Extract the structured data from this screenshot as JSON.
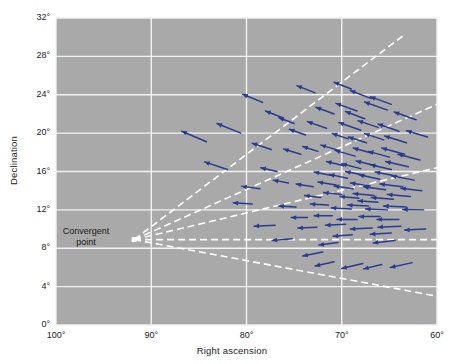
{
  "chart_data": {
    "type": "scatter",
    "title": "",
    "xlabel": "Right ascension",
    "ylabel": "Declination",
    "xlim": [
      100,
      60
    ],
    "ylim": [
      0,
      32
    ],
    "x_ticks": [
      "100°",
      "90°",
      "80°",
      "70°",
      "60°"
    ],
    "x_tick_values": [
      100,
      90,
      80,
      70,
      60
    ],
    "y_ticks": [
      "0°",
      "4°",
      "8°",
      "12°",
      "16°",
      "20°",
      "24°",
      "28°",
      "32°"
    ],
    "y_tick_values": [
      0,
      4,
      8,
      12,
      16,
      20,
      24,
      28,
      32
    ],
    "grid": true,
    "legend": "none",
    "plot_bg_color": "#a9a9a9",
    "grid_color": "#f2f2f2",
    "vector_color": "#2b3a8f",
    "convergent_line_color": "#ffffff",
    "annotations": [
      {
        "name": "convergent-point",
        "label": "Convergent\npoint",
        "label_line_1": "Convergent",
        "label_line_2": "point",
        "x": 91.8,
        "y": 8.9,
        "marker": "white-square"
      }
    ],
    "convergence_rays": [
      {
        "x_end": 63.5,
        "y_end": 30.2
      },
      {
        "x_end": 60.0,
        "y_end": 23.0
      },
      {
        "x_end": 60.0,
        "y_end": 16.4
      },
      {
        "x_end": 60.0,
        "y_end": 8.9
      },
      {
        "x_end": 60.0,
        "y_end": 3.0
      }
    ],
    "vectors": [
      {
        "x": 78.3,
        "y": 23.2,
        "dx": 2.1,
        "dy": 0.85
      },
      {
        "x": 72.8,
        "y": 24.2,
        "dx": 1.9,
        "dy": 0.75
      },
      {
        "x": 80.6,
        "y": 20.0,
        "dx": 2.5,
        "dy": 1.0
      },
      {
        "x": 75.0,
        "y": 21.0,
        "dx": 1.6,
        "dy": 0.6
      },
      {
        "x": 70.8,
        "y": 22.0,
        "dx": 1.9,
        "dy": 0.7
      },
      {
        "x": 68.4,
        "y": 22.3,
        "dx": 2.2,
        "dy": 0.8
      },
      {
        "x": 65.2,
        "y": 22.4,
        "dx": 2.4,
        "dy": 0.85
      },
      {
        "x": 71.6,
        "y": 20.5,
        "dx": 2.0,
        "dy": 0.7
      },
      {
        "x": 68.0,
        "y": 20.3,
        "dx": 2.3,
        "dy": 0.8
      },
      {
        "x": 66.2,
        "y": 20.6,
        "dx": 2.1,
        "dy": 0.7
      },
      {
        "x": 64.0,
        "y": 20.2,
        "dx": 2.2,
        "dy": 0.75
      },
      {
        "x": 69.3,
        "y": 19.4,
        "dx": 1.7,
        "dy": 0.55
      },
      {
        "x": 67.4,
        "y": 19.0,
        "dx": 1.9,
        "dy": 0.6
      },
      {
        "x": 65.6,
        "y": 19.3,
        "dx": 2.0,
        "dy": 0.65
      },
      {
        "x": 63.2,
        "y": 19.0,
        "dx": 2.3,
        "dy": 0.7
      },
      {
        "x": 77.4,
        "y": 18.3,
        "dx": 2.0,
        "dy": 0.65
      },
      {
        "x": 74.3,
        "y": 17.8,
        "dx": 1.8,
        "dy": 0.55
      },
      {
        "x": 72.5,
        "y": 18.1,
        "dx": 1.6,
        "dy": 0.5
      },
      {
        "x": 70.3,
        "y": 18.2,
        "dx": 1.9,
        "dy": 0.55
      },
      {
        "x": 68.6,
        "y": 17.6,
        "dx": 2.1,
        "dy": 0.6
      },
      {
        "x": 66.8,
        "y": 17.9,
        "dx": 2.0,
        "dy": 0.55
      },
      {
        "x": 65.0,
        "y": 17.5,
        "dx": 2.2,
        "dy": 0.6
      },
      {
        "x": 63.4,
        "y": 17.8,
        "dx": 2.4,
        "dy": 0.65
      },
      {
        "x": 61.8,
        "y": 17.2,
        "dx": 2.3,
        "dy": 0.6
      },
      {
        "x": 69.8,
        "y": 16.6,
        "dx": 1.8,
        "dy": 0.45
      },
      {
        "x": 68.0,
        "y": 16.3,
        "dx": 2.0,
        "dy": 0.5
      },
      {
        "x": 66.4,
        "y": 16.6,
        "dx": 2.1,
        "dy": 0.5
      },
      {
        "x": 64.8,
        "y": 16.2,
        "dx": 2.2,
        "dy": 0.5
      },
      {
        "x": 63.0,
        "y": 16.5,
        "dx": 2.4,
        "dy": 0.55
      },
      {
        "x": 71.2,
        "y": 15.6,
        "dx": 1.7,
        "dy": 0.35
      },
      {
        "x": 69.4,
        "y": 15.3,
        "dx": 1.9,
        "dy": 0.4
      },
      {
        "x": 67.6,
        "y": 15.6,
        "dx": 2.0,
        "dy": 0.4
      },
      {
        "x": 66.0,
        "y": 15.2,
        "dx": 2.2,
        "dy": 0.45
      },
      {
        "x": 64.2,
        "y": 15.5,
        "dx": 2.3,
        "dy": 0.45
      },
      {
        "x": 62.4,
        "y": 15.1,
        "dx": 2.4,
        "dy": 0.45
      },
      {
        "x": 75.6,
        "y": 14.8,
        "dx": 1.6,
        "dy": 0.3
      },
      {
        "x": 73.0,
        "y": 14.4,
        "dx": 1.8,
        "dy": 0.3
      },
      {
        "x": 70.6,
        "y": 14.6,
        "dx": 1.9,
        "dy": 0.3
      },
      {
        "x": 68.8,
        "y": 14.2,
        "dx": 2.0,
        "dy": 0.3
      },
      {
        "x": 67.0,
        "y": 14.5,
        "dx": 2.1,
        "dy": 0.3
      },
      {
        "x": 65.4,
        "y": 14.1,
        "dx": 2.3,
        "dy": 0.3
      },
      {
        "x": 63.6,
        "y": 14.4,
        "dx": 2.4,
        "dy": 0.3
      },
      {
        "x": 61.6,
        "y": 14.0,
        "dx": 2.2,
        "dy": 0.25
      },
      {
        "x": 72.2,
        "y": 13.3,
        "dx": 1.7,
        "dy": 0.2
      },
      {
        "x": 70.0,
        "y": 13.6,
        "dx": 1.9,
        "dy": 0.2
      },
      {
        "x": 68.2,
        "y": 13.2,
        "dx": 2.0,
        "dy": 0.2
      },
      {
        "x": 66.6,
        "y": 13.5,
        "dx": 2.2,
        "dy": 0.2
      },
      {
        "x": 64.6,
        "y": 13.1,
        "dx": 2.3,
        "dy": 0.2
      },
      {
        "x": 62.8,
        "y": 13.4,
        "dx": 2.4,
        "dy": 0.2
      },
      {
        "x": 79.4,
        "y": 12.6,
        "dx": 2.0,
        "dy": 0.15
      },
      {
        "x": 74.8,
        "y": 12.3,
        "dx": 1.8,
        "dy": 0.1
      },
      {
        "x": 71.4,
        "y": 12.5,
        "dx": 1.9,
        "dy": 0.1
      },
      {
        "x": 69.0,
        "y": 12.1,
        "dx": 2.1,
        "dy": 0.1
      },
      {
        "x": 67.2,
        "y": 12.4,
        "dx": 2.2,
        "dy": 0.1
      },
      {
        "x": 65.2,
        "y": 12.0,
        "dx": 2.3,
        "dy": 0.1
      },
      {
        "x": 63.2,
        "y": 12.3,
        "dx": 2.4,
        "dy": 0.1
      },
      {
        "x": 61.4,
        "y": 12.0,
        "dx": 2.2,
        "dy": 0.05
      },
      {
        "x": 73.6,
        "y": 11.2,
        "dx": 1.7,
        "dy": 0.0
      },
      {
        "x": 71.0,
        "y": 11.4,
        "dx": 1.9,
        "dy": 0.0
      },
      {
        "x": 68.4,
        "y": 11.0,
        "dx": 2.1,
        "dy": 0.0
      },
      {
        "x": 66.0,
        "y": 11.3,
        "dx": 2.2,
        "dy": 0.0
      },
      {
        "x": 64.0,
        "y": 11.0,
        "dx": 2.3,
        "dy": 0.0
      },
      {
        "x": 77.0,
        "y": 10.4,
        "dx": 2.2,
        "dy": -0.1
      },
      {
        "x": 72.6,
        "y": 10.2,
        "dx": 2.0,
        "dy": -0.1
      },
      {
        "x": 69.6,
        "y": 10.5,
        "dx": 2.1,
        "dy": -0.1
      },
      {
        "x": 66.8,
        "y": 10.1,
        "dx": 2.3,
        "dy": -0.1
      },
      {
        "x": 63.8,
        "y": 10.3,
        "dx": 2.4,
        "dy": -0.1
      },
      {
        "x": 61.2,
        "y": 10.0,
        "dx": 2.2,
        "dy": -0.1
      },
      {
        "x": 75.2,
        "y": 9.0,
        "dx": 2.1,
        "dy": -0.2
      },
      {
        "x": 70.4,
        "y": 8.6,
        "dx": 2.0,
        "dy": -0.25
      },
      {
        "x": 64.4,
        "y": 8.8,
        "dx": 2.3,
        "dy": -0.25
      },
      {
        "x": 72.0,
        "y": 7.6,
        "dx": 2.1,
        "dy": -0.4
      },
      {
        "x": 67.8,
        "y": 6.4,
        "dx": 2.2,
        "dy": -0.5
      },
      {
        "x": 65.8,
        "y": 6.3,
        "dx": 1.9,
        "dy": -0.45
      },
      {
        "x": 62.6,
        "y": 6.5,
        "dx": 2.3,
        "dy": -0.5
      },
      {
        "x": 84.2,
        "y": 19.1,
        "dx": 2.6,
        "dy": 1.1
      },
      {
        "x": 82.0,
        "y": 16.2,
        "dx": 2.4,
        "dy": 0.8
      },
      {
        "x": 73.8,
        "y": 19.8,
        "dx": 1.7,
        "dy": 0.6
      },
      {
        "x": 76.2,
        "y": 21.6,
        "dx": 1.8,
        "dy": 0.7
      },
      {
        "x": 66.9,
        "y": 23.6,
        "dx": 2.2,
        "dy": 0.85
      },
      {
        "x": 62.2,
        "y": 21.4,
        "dx": 2.3,
        "dy": 0.8
      },
      {
        "x": 76.8,
        "y": 16.0,
        "dx": 1.7,
        "dy": 0.4
      },
      {
        "x": 78.6,
        "y": 14.2,
        "dx": 1.9,
        "dy": 0.25
      },
      {
        "x": 67.6,
        "y": 21.5,
        "dx": 2.0,
        "dy": 0.75
      },
      {
        "x": 64.8,
        "y": 23.0,
        "dx": 2.2,
        "dy": 0.8
      },
      {
        "x": 61.0,
        "y": 19.6,
        "dx": 2.2,
        "dy": 0.65
      },
      {
        "x": 69.0,
        "y": 24.6,
        "dx": 1.8,
        "dy": 0.7
      },
      {
        "x": 66.2,
        "y": 12.8,
        "dx": 2.1,
        "dy": 0.15
      },
      {
        "x": 68.9,
        "y": 9.4,
        "dx": 2.0,
        "dy": -0.15
      },
      {
        "x": 64.8,
        "y": 9.6,
        "dx": 2.2,
        "dy": -0.15
      },
      {
        "x": 70.8,
        "y": 6.6,
        "dx": 2.0,
        "dy": -0.45
      }
    ]
  }
}
